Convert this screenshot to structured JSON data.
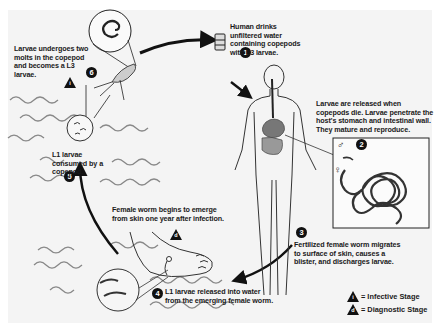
{
  "diagram": {
    "steps": [
      {
        "number": "1",
        "text": "Human drinks unfiltered water containing copepods with L3 larvae."
      },
      {
        "number": "2",
        "text": "Larvae are released when copepods die. Larvae penetrate the host's stomach and intestinal wall. They mature and reproduce."
      },
      {
        "number": "3",
        "text": "Fertilized female worm migrates to surface of skin, causes a blister, and discharges larvae."
      },
      {
        "number": "4",
        "text": "L1 larvae released into water from the emerging female worm."
      },
      {
        "number": "5",
        "text": "L1 larvae consumed by a copepod."
      },
      {
        "number": "6",
        "text": "Larvae undergoes two molts in the copepod and becomes a L3 larvae."
      }
    ],
    "annotations": {
      "emergence": "Female worm begins to emerge from skin one year after infection.",
      "male_symbol": "♂",
      "female_symbol": "♀"
    },
    "stage_markers": {
      "infective": "i",
      "diagnostic": "d"
    },
    "legend": {
      "infective": {
        "symbol": "i",
        "label": "= Infective Stage"
      },
      "diagnostic": {
        "symbol": "d",
        "label": "= Diagnostic Stage"
      }
    }
  }
}
